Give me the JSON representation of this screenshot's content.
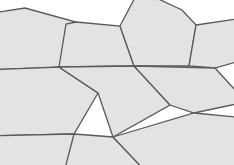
{
  "figure": {
    "name": "pentagonal-tiling",
    "width": 234,
    "height": 165,
    "background_color": "#ffffff",
    "tile_fill_color": "#e3e3e3",
    "tile_stroke_color": "#5a5a5a",
    "tile_stroke_width": 1.3,
    "tile_count": 9,
    "shape_kind": "pentagon"
  },
  "tiles": [
    {
      "id": "tile-top-left",
      "label": "top-left pentagon",
      "points": "-14,14 25,8 76,22 70,67 -16,70"
    },
    {
      "id": "tile-top-center",
      "label": "top-center pentagon",
      "points": "76,22 120,26 134,66 59,67 66,24"
    },
    {
      "id": "tile-top-right",
      "label": "top-right pentagon",
      "points": "139,-10 182,10 196,25 189,66 134,66 120,26"
    },
    {
      "id": "tile-right-upper",
      "label": "upper-right pentagon",
      "points": "196,25 243,18 250,58 215,68 189,66"
    },
    {
      "id": "tile-left-middle",
      "label": "left-middle pentagon",
      "points": "-16,70 59,67 98,93 74,134 -18,136"
    },
    {
      "id": "tile-center",
      "label": "center pentagon",
      "points": "59,67 134,66 170,105 113,137 98,93"
    },
    {
      "id": "tile-right-middle",
      "label": "right-middle pentagon",
      "points": "134,66 215,68 246,102 194,113 170,105"
    },
    {
      "id": "tile-bottom-left",
      "label": "bottom-left pentagon",
      "points": "-18,136 74,134 90,178 35,190 -22,176"
    },
    {
      "id": "tile-bottom-center",
      "label": "bottom-center pentagon",
      "points": "74,134 113,137 150,176 120,196 62,180"
    },
    {
      "id": "tile-bottom-right",
      "label": "bottom-right pentagon",
      "points": "113,137 194,113 246,118 240,178 150,176"
    }
  ],
  "edges": [
    {
      "id": "edge-top-center-horizontal",
      "from": "76,22",
      "to": "120,26"
    },
    {
      "id": "edge-left-horizontal",
      "from": "-16,70",
      "to": "59,67"
    },
    {
      "id": "edge-right-horizontal",
      "from": "134,66",
      "to": "215,68"
    },
    {
      "id": "edge-bottom-horizontal",
      "from": "113,137",
      "to": "240,178"
    }
  ],
  "junctions": [
    {
      "id": "junction-top-left",
      "x": 76,
      "y": 22,
      "degree": 3
    },
    {
      "id": "junction-top-center",
      "x": 120,
      "y": 26,
      "degree": 3
    },
    {
      "id": "junction-top-right",
      "x": 196,
      "y": 25,
      "degree": 3
    },
    {
      "id": "junction-left-middle",
      "x": 59,
      "y": 67,
      "degree": 3
    },
    {
      "id": "junction-center-top",
      "x": 134,
      "y": 66,
      "degree": 3
    },
    {
      "id": "junction-right-middle",
      "x": 215,
      "y": 68,
      "degree": 3
    },
    {
      "id": "junction-center-left",
      "x": 98,
      "y": 93,
      "degree": 3
    },
    {
      "id": "junction-center-right",
      "x": 170,
      "y": 105,
      "degree": 3
    },
    {
      "id": "junction-right-peak",
      "x": 194,
      "y": 113,
      "degree": 3
    },
    {
      "id": "junction-bottom-left",
      "x": 74,
      "y": 134,
      "degree": 3
    },
    {
      "id": "junction-bottom-center",
      "x": 113,
      "y": 137,
      "degree": 3
    }
  ]
}
